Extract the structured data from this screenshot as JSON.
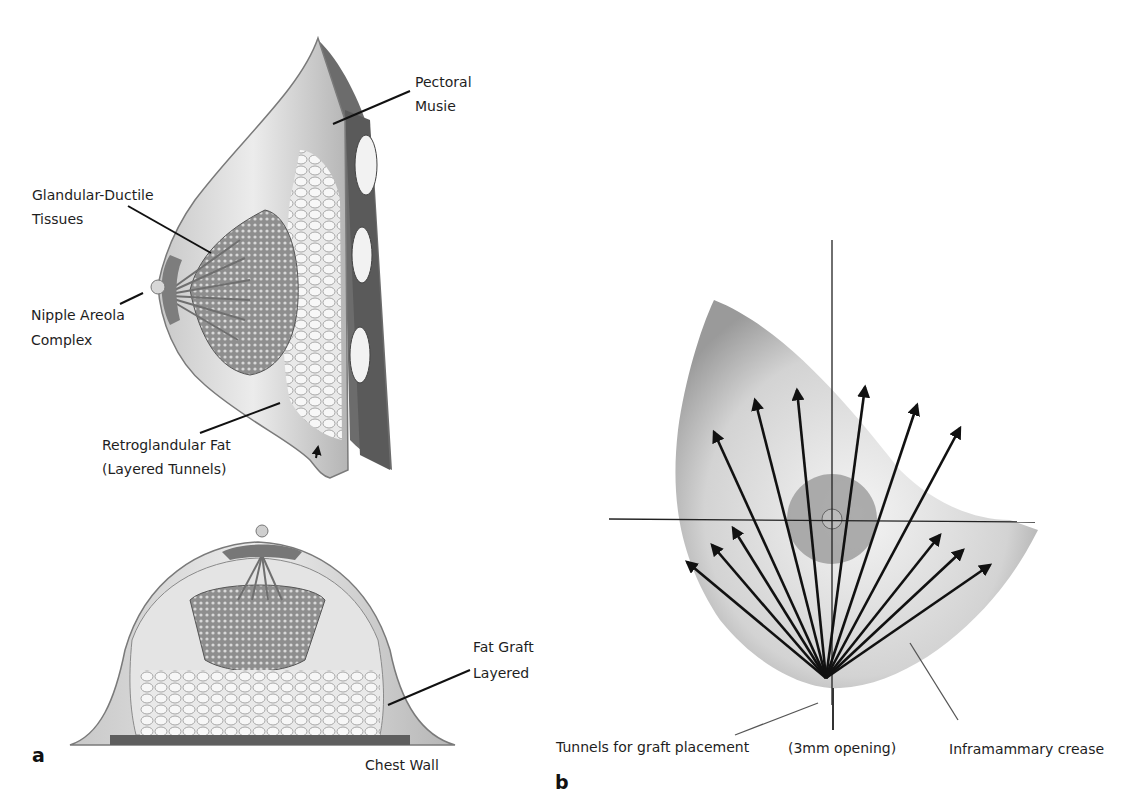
{
  "figure": {
    "panel_a": {
      "letter": "a",
      "sagittal_view": {
        "labels": {
          "pectoral": [
            "Pectoral",
            "Musie"
          ],
          "glandular": [
            "Glandular-Ductile",
            "Tissues"
          ],
          "nipple": [
            "Nipple Areola",
            "Complex"
          ],
          "retroglandular": [
            "Retroglandular Fat",
            "(Layered Tunnels)"
          ]
        }
      },
      "axial_view": {
        "labels": {
          "fat_graft": [
            "Fat Graft",
            "Layered"
          ],
          "chest_wall": "Chest Wall"
        }
      }
    },
    "panel_b": {
      "letter": "b",
      "labels": {
        "tunnels": "Tunnels for graft placement",
        "opening": "(3mm opening)",
        "crease": "Inframammary crease"
      },
      "arrow_origin": [
        826,
        678
      ],
      "arrow_tips": [
        [
          687,
          562
        ],
        [
          712,
          545
        ],
        [
          733,
          528
        ],
        [
          714,
          432
        ],
        [
          755,
          400
        ],
        [
          797,
          390
        ],
        [
          865,
          387
        ],
        [
          917,
          405
        ],
        [
          960,
          428
        ],
        [
          940,
          535
        ],
        [
          963,
          550
        ],
        [
          990,
          565
        ]
      ],
      "crosshair": {
        "vertical_x": 832,
        "vertical_y": [
          240,
          705
        ],
        "horizontal_y": 519,
        "horizontal_x": [
          609,
          1035
        ]
      }
    },
    "colors": {
      "ink": "#111111",
      "tissue_light": "#e8e8e8",
      "tissue_mid": "#bdbdbd",
      "tissue_dark": "#7a7a7a"
    }
  }
}
